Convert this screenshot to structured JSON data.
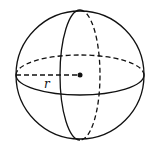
{
  "diagram": {
    "radius_label": "r",
    "stroke_color": "#111111",
    "background": "#ffffff",
    "sphere": {
      "cx": 80,
      "cy": 75,
      "r": 64
    },
    "equator": {
      "rx": 64,
      "ry": 20
    },
    "meridian": {
      "rx": 20,
      "ry": 65
    },
    "center_point": {
      "cx": 80,
      "cy": 75,
      "r": 2.5
    }
  }
}
